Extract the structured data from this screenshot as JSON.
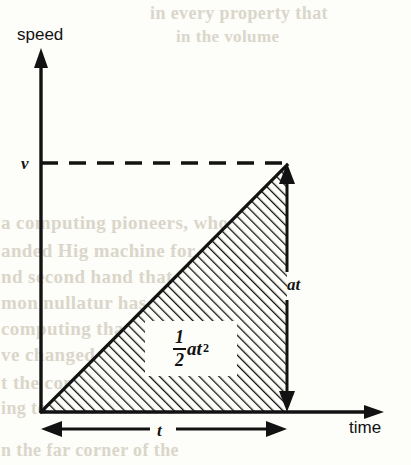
{
  "figure": {
    "kind": "speed-time-graph",
    "axes": {
      "y_label": "speed",
      "x_label": "time",
      "y_value_label": "v",
      "x_value_label": "t"
    },
    "annotations": {
      "vertical_rise_label": "at",
      "area_numerator": "1",
      "area_denominator": "2",
      "area_symbol": "at",
      "area_exponent": "2"
    },
    "colors": {
      "ink": "#121212",
      "paper": "#fdfdf9",
      "ghost_text": "#ddd9ce"
    },
    "geometry": {
      "origin_x": 41,
      "origin_y": 412,
      "apex_x": 287,
      "apex_y": 165,
      "y_axis_top": 52,
      "x_axis_right": 383,
      "dashed_y": 163
    }
  },
  "chart_data": {
    "type": "line",
    "title": "",
    "xlabel": "time",
    "ylabel": "speed",
    "grid": false,
    "legend": null,
    "x": [
      0,
      1
    ],
    "series": [
      {
        "name": "speed",
        "values": [
          0,
          1
        ]
      }
    ],
    "tick_labels": {
      "x": [
        "t"
      ],
      "y": [
        "v"
      ]
    },
    "annotations": [
      {
        "text": "at",
        "meaning": "vertical rise from 0 to v equals acceleration times time"
      },
      {
        "text": "1/2 at^2",
        "meaning": "shaded triangular area under the line equals distance travelled"
      },
      {
        "text": "t",
        "meaning": "horizontal extent of the motion along the time axis"
      },
      {
        "text": "v",
        "meaning": "final speed marked by the dashed horizontal construction line"
      }
    ],
    "xlim": [
      0,
      1.39
    ],
    "ylim": [
      0,
      1.45
    ]
  },
  "ghost_text": {
    "lines": [
      {
        "text": "in every property that",
        "x": 150,
        "y": 3,
        "size": 18,
        "strong": true
      },
      {
        "text": "in the volume",
        "x": 176,
        "y": 27,
        "size": 17,
        "strong": true
      },
      {
        "text": "a computing pioneers, who or",
        "x": 1,
        "y": 212,
        "size": 19,
        "strong": true
      },
      {
        "text": "anded Hig machine for carbo",
        "x": 1,
        "y": 240,
        "size": 19,
        "strong": true
      },
      {
        "text": "nd second hand that the v",
        "x": 1,
        "y": 266,
        "size": 19,
        "strong": true
      },
      {
        "text": "mon nullatur has  allied with",
        "x": 1,
        "y": 292,
        "size": 19,
        "strong": true
      },
      {
        "text": "computing that  the ex",
        "x": 1,
        "y": 318,
        "size": 19,
        "strong": true
      },
      {
        "text": "ve changed nutat  ch",
        "x": 1,
        "y": 344,
        "size": 19,
        "strong": true
      },
      {
        "text": "t the contributions of mech",
        "x": 1,
        "y": 372,
        "size": 19,
        "strong": true
      },
      {
        "text": "ing to be a recent and",
        "x": 1,
        "y": 398,
        "size": 18,
        "strong": true
      },
      {
        "text": "n the far corner of the",
        "x": 1,
        "y": 440,
        "size": 18,
        "strong": true
      }
    ]
  }
}
